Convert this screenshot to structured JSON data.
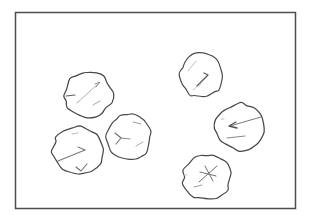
{
  "figure": {
    "canvas": {
      "width": 311,
      "height": 218,
      "background": "#ffffff"
    },
    "frame": {
      "x": 15.5,
      "y": 12.5,
      "width": 280,
      "height": 196,
      "stroke": "#4d4d4d",
      "stroke_width": 1.5
    },
    "blobs": [
      {
        "name": "blob-top-left",
        "cx": 88.5,
        "cy": 94.5,
        "rx": 23.5,
        "ry": 23,
        "seed": 3,
        "wobble": 0.075,
        "outline": "#474747",
        "outline_width": 1.25,
        "fill": "#ffffff",
        "marks": [
          {
            "points": [
              [
                77,
                103
              ],
              [
                99,
                83
              ]
            ],
            "stroke": "#b3b3b3",
            "width": 1
          },
          {
            "points": [
              [
                95,
                84
              ],
              [
                100,
                82
              ],
              [
                96,
                87
              ]
            ],
            "stroke": "#8f8f8f",
            "width": 1
          },
          {
            "points": [
              [
                66,
                96
              ],
              [
                75,
                95
              ]
            ],
            "stroke": "#5f5f5f",
            "width": 1.2
          },
          {
            "points": [
              [
                93,
                105
              ],
              [
                100,
                101
              ]
            ],
            "stroke": "#a6a6a6",
            "width": 1
          }
        ]
      },
      {
        "name": "blob-left-middle",
        "cx": 78,
        "cy": 150.5,
        "rx": 25,
        "ry": 23.5,
        "seed": 7,
        "wobble": 0.07,
        "outline": "#4a4a4a",
        "outline_width": 1.25,
        "fill": "#ffffff",
        "marks": [
          {
            "points": [
              [
                58,
                161
              ],
              [
                85,
                150
              ]
            ],
            "stroke": "#7a7a7a",
            "width": 1.1
          },
          {
            "points": [
              [
                85,
                150
              ],
              [
                78,
                147
              ]
            ],
            "stroke": "#7a7a7a",
            "width": 1.1
          },
          {
            "points": [
              [
                76,
                167
              ],
              [
                81,
                171
              ],
              [
                87,
                164
              ]
            ],
            "stroke": "#6f6f6f",
            "width": 1.1
          },
          {
            "points": [
              [
                72,
                134
              ],
              [
                78,
                133
              ]
            ],
            "stroke": "#bdbdbd",
            "width": 1
          }
        ]
      },
      {
        "name": "blob-center",
        "cx": 128.5,
        "cy": 137,
        "rx": 22.5,
        "ry": 23,
        "seed": 13,
        "wobble": 0.065,
        "outline": "#4a4a4a",
        "outline_width": 1.2,
        "fill": "#ffffff",
        "marks": [
          {
            "points": [
              [
                115,
                133
              ],
              [
                121,
                138
              ],
              [
                116,
                144
              ]
            ],
            "stroke": "#6f6f6f",
            "width": 1.1
          },
          {
            "points": [
              [
                121,
                138
              ],
              [
                130,
                139
              ]
            ],
            "stroke": "#8a8a8a",
            "width": 1
          },
          {
            "points": [
              [
                133,
                122
              ],
              [
                141,
                124
              ]
            ],
            "stroke": "#9e9e9e",
            "width": 1
          },
          {
            "points": [
              [
                136,
                146
              ],
              [
                143,
                142
              ]
            ],
            "stroke": "#ababab",
            "width": 1
          }
        ]
      },
      {
        "name": "blob-top-right",
        "cx": 201.5,
        "cy": 75.5,
        "rx": 21.5,
        "ry": 22.5,
        "seed": 21,
        "wobble": 0.07,
        "outline": "#4a4a4a",
        "outline_width": 1.2,
        "fill": "#ffffff",
        "marks": [
          {
            "points": [
              [
                188,
                71
              ],
              [
                196,
                61
              ]
            ],
            "stroke": "#c0c0c0",
            "width": 1
          },
          {
            "points": [
              [
                197,
                86
              ],
              [
                208,
                75
              ],
              [
                204,
                73
              ]
            ],
            "stroke": "#5a5a5a",
            "width": 1.3
          },
          {
            "points": [
              [
                193,
                90
              ],
              [
                201,
                84
              ]
            ],
            "stroke": "#cacaca",
            "width": 1
          }
        ]
      },
      {
        "name": "blob-right-middle",
        "cx": 240,
        "cy": 127,
        "rx": 24,
        "ry": 23.5,
        "seed": 29,
        "wobble": 0.075,
        "outline": "#454545",
        "outline_width": 1.25,
        "fill": "#ffffff",
        "marks": [
          {
            "points": [
              [
                261,
                117
              ],
              [
                230,
                126
              ]
            ],
            "stroke": "#7a7a7a",
            "width": 1
          },
          {
            "points": [
              [
                236,
                122
              ],
              [
                229,
                126
              ],
              [
                237,
                128
              ]
            ],
            "stroke": "#4f4f4f",
            "width": 1.3
          },
          {
            "points": [
              [
                227,
                138
              ],
              [
                245,
                136
              ]
            ],
            "stroke": "#8a8a8a",
            "width": 1
          },
          {
            "points": [
              [
                221,
                119
              ],
              [
                224,
                119
              ]
            ],
            "stroke": "#bdbdbd",
            "width": 1
          }
        ]
      },
      {
        "name": "blob-bottom-right",
        "cx": 207,
        "cy": 177,
        "rx": 24,
        "ry": 22.5,
        "seed": 42,
        "wobble": 0.07,
        "outline": "#4a4a4a",
        "outline_width": 1.25,
        "fill": "#ffffff",
        "marks": [
          {
            "points": [
              [
                199,
                182
              ],
              [
                217,
                166
              ]
            ],
            "stroke": "#6f6f6f",
            "width": 1
          },
          {
            "points": [
              [
                205,
                166
              ],
              [
                213,
                181
              ]
            ],
            "stroke": "#6f6f6f",
            "width": 1
          },
          {
            "points": [
              [
                200,
                172
              ],
              [
                216,
                176
              ]
            ],
            "stroke": "#6f6f6f",
            "width": 1
          },
          {
            "points": [
              [
                194,
                187
              ],
              [
                202,
                185
              ]
            ],
            "stroke": "#9a9a9a",
            "width": 1
          },
          {
            "points": [
              [
                184,
                175
              ],
              [
                187,
                175
              ]
            ],
            "stroke": "#c4c4c4",
            "width": 1
          }
        ]
      }
    ]
  }
}
